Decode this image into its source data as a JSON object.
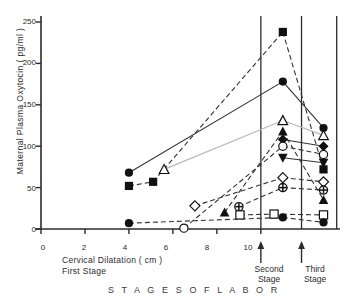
{
  "chart_data": {
    "type": "scatter",
    "title": "",
    "subtitle": "",
    "xlabel": "Cervical Dilatation ( cm )",
    "ylabel": "Maternal Plasma Oxytocin ( pg/ml )",
    "xlim": [
      0,
      13.6
    ],
    "ylim": [
      0,
      250
    ],
    "grid": false,
    "legend": "none",
    "yticks": [
      0,
      50,
      100,
      150,
      200,
      250
    ],
    "ytick_labels": [
      "0",
      "50",
      "100",
      "150",
      "200",
      "250"
    ],
    "xticks": [
      0,
      2,
      4,
      6,
      8,
      10
    ],
    "xtick_labels": [
      "0",
      "2",
      "4",
      "6",
      "8",
      "10"
    ],
    "annotations": [
      {
        "text": "First  Stage",
        "x": 3.0,
        "y": -52
      },
      {
        "text": "Second",
        "x": 10.4,
        "y": -36
      },
      {
        "text": "Stage",
        "x": 10.4,
        "y": -48
      },
      {
        "text": "Third",
        "x": 12.3,
        "y": -36
      },
      {
        "text": "Stage",
        "x": 12.3,
        "y": -48
      },
      {
        "text": "S T A G E S     O F     L A B O R",
        "x": 7.0,
        "y": -76
      }
    ],
    "vertical_dividers": [
      10.0,
      11.85,
      13.45
    ],
    "series": [
      {
        "name": "Subject A",
        "marker": "filled-square",
        "line": "dashed",
        "points": [
          {
            "x": 4.0,
            "y": 52
          },
          {
            "x": 5.1,
            "y": 57
          },
          {
            "x": 11.0,
            "y": 238
          },
          {
            "x": 12.85,
            "y": 72
          }
        ]
      },
      {
        "name": "Subject B",
        "marker": "filled-circle",
        "line": "solid",
        "points": [
          {
            "x": 4.0,
            "y": 68
          },
          {
            "x": 11.0,
            "y": 178
          },
          {
            "x": 12.85,
            "y": 122
          }
        ]
      },
      {
        "name": "Subject C",
        "marker": "open-triangle-up",
        "line": "solid-light",
        "points": [
          {
            "x": 5.6,
            "y": 72
          },
          {
            "x": 11.0,
            "y": 131
          },
          {
            "x": 12.85,
            "y": 113
          }
        ]
      },
      {
        "name": "Subject D",
        "marker": "filled-triangle-up",
        "line": "dashed",
        "points": [
          {
            "x": 8.35,
            "y": 20
          },
          {
            "x": 11.0,
            "y": 118
          },
          {
            "x": 12.85,
            "y": 35
          }
        ]
      },
      {
        "name": "Subject E",
        "marker": "filled-diamond",
        "line": "solid",
        "points": [
          {
            "x": 11.0,
            "y": 108
          },
          {
            "x": 12.85,
            "y": 100
          }
        ]
      },
      {
        "name": "Subject F",
        "marker": "open-circle",
        "line": "dashed",
        "points": [
          {
            "x": 6.5,
            "y": 1
          },
          {
            "x": 11.0,
            "y": 100
          },
          {
            "x": 12.85,
            "y": 90
          }
        ]
      },
      {
        "name": "Subject G",
        "marker": "filled-triangle-down",
        "line": "solid",
        "points": [
          {
            "x": 11.0,
            "y": 86
          },
          {
            "x": 12.85,
            "y": 80
          }
        ]
      },
      {
        "name": "Subject H",
        "marker": "open-diamond",
        "line": "dashed",
        "points": [
          {
            "x": 7.0,
            "y": 28
          },
          {
            "x": 11.0,
            "y": 62
          },
          {
            "x": 12.85,
            "y": 57
          }
        ]
      },
      {
        "name": "Subject I",
        "marker": "circle-cross",
        "line": "dashed",
        "points": [
          {
            "x": 9.0,
            "y": 27
          },
          {
            "x": 11.0,
            "y": 50
          },
          {
            "x": 12.85,
            "y": 47
          }
        ]
      },
      {
        "name": "Subject J",
        "marker": "open-square",
        "line": "dashed",
        "points": [
          {
            "x": 9.05,
            "y": 17
          },
          {
            "x": 10.6,
            "y": 18
          },
          {
            "x": 12.85,
            "y": 17
          }
        ]
      },
      {
        "name": "Subject K",
        "marker": "filled-circle",
        "line": "dashed",
        "points": [
          {
            "x": 4.0,
            "y": 7
          },
          {
            "x": 11.0,
            "y": 14
          },
          {
            "x": 12.85,
            "y": 8
          }
        ]
      }
    ],
    "colors": {
      "axis": "#2b2b2b",
      "marker_fill": "#111111",
      "marker_open": "#ffffff",
      "line": "#333333"
    }
  },
  "axis": {
    "y_title": "Maternal  Plasma   Oxytocin   ( pg/ml )",
    "x_title": "Cervical  Dilatation  ( cm )",
    "first_stage": "First    Stage",
    "second_stage_line1": "Second",
    "second_stage_line2": "Stage",
    "third_stage_line1": "Third",
    "third_stage_line2": "Stage",
    "footer": "S T A G E S      O F      L A B O R",
    "ytick_0": "0",
    "ytick_50": "50",
    "ytick_100": "100",
    "ytick_150": "150",
    "ytick_200": "200",
    "ytick_250": "250",
    "xtick_0": "0",
    "xtick_2": "2",
    "xtick_4": "4",
    "xtick_6": "6",
    "xtick_8": "8",
    "xtick_10": "10"
  }
}
